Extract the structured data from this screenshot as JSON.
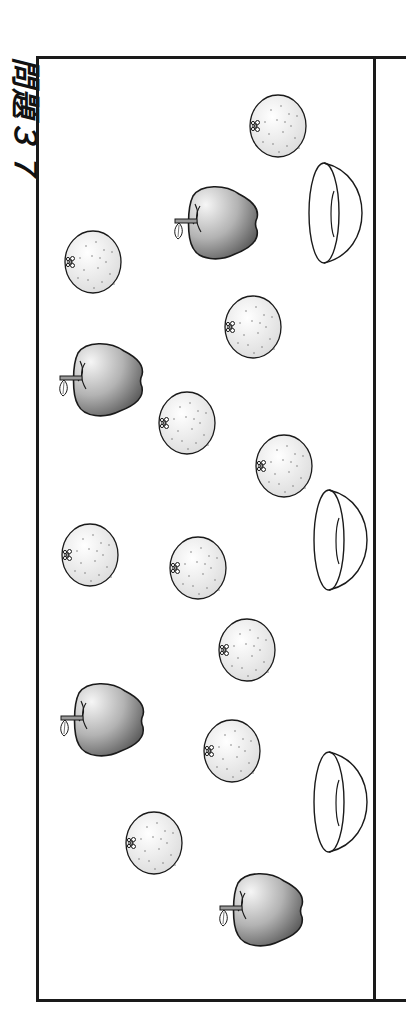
{
  "worksheet": {
    "title": "問題３７",
    "orientation": "rotated 90° clockwise",
    "colors": {
      "line": "#1a1a1a",
      "orange_fill": "#f2f2f2",
      "apple_dark": "#6e6e6e",
      "apple_light": "#f4f4f4",
      "background": "#ffffff"
    }
  },
  "objects": {
    "oranges": [
      {
        "cx": 278,
        "cy": 126
      },
      {
        "cx": 93,
        "cy": 262
      },
      {
        "cx": 253,
        "cy": 327
      },
      {
        "cx": 187,
        "cy": 423
      },
      {
        "cx": 284,
        "cy": 466
      },
      {
        "cx": 90,
        "cy": 555
      },
      {
        "cx": 198,
        "cy": 568
      },
      {
        "cx": 247,
        "cy": 650
      },
      {
        "cx": 232,
        "cy": 751
      },
      {
        "cx": 154,
        "cy": 843
      }
    ],
    "apples": [
      {
        "cx": 218,
        "cy": 222
      },
      {
        "cx": 103,
        "cy": 379
      },
      {
        "cx": 104,
        "cy": 719
      },
      {
        "cx": 263,
        "cy": 909
      }
    ],
    "bowls": [
      {
        "cx": 335,
        "cy": 213
      },
      {
        "cx": 340,
        "cy": 540
      },
      {
        "cx": 340,
        "cy": 802
      }
    ],
    "counts": {
      "oranges": 10,
      "apples": 4,
      "bowls": 3
    }
  }
}
